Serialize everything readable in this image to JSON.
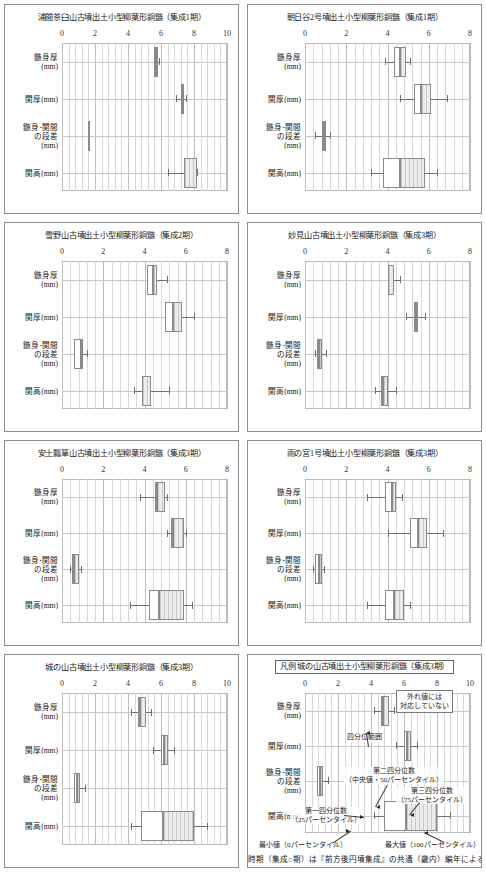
{
  "figure": {
    "axis_labels": [
      "鏃身厚\n(mm)",
      "関厚(mm)",
      "鏃身-関間\nの段差\n(mm)",
      "関高(mm)"
    ],
    "footer_note": "時期（集成○期）は『前方後円墳集成』の共通（畿内）編年による"
  },
  "legend_annotations": {
    "outlier": "外れ値には\n対応していない",
    "iqr_range": "四分位範囲",
    "median": "第二四分位数\n（中央値・50パーセンタイル）",
    "q3": "第三四分位数\n（75パーセンタイル）",
    "q1": "第一四分位数\n（25パーセンタイル）",
    "min": "最小値（0パーセンタイル）",
    "max": "最大値（100パーセンタイル）"
  },
  "chart_data": [
    {
      "type": "boxplot",
      "title": "浦間茶臼山古墳出土小型柳葉形銅鏃（集成1期）",
      "xlim": [
        0,
        10
      ],
      "xticks": [
        0,
        2,
        4,
        6,
        8,
        10
      ],
      "minor_per_major": 5,
      "grid": true,
      "xlabel": "",
      "ylabel": "",
      "categories": [
        "鏃身厚(mm)",
        "関厚(mm)",
        "鏃身-関間の段差(mm)",
        "関高(mm)"
      ],
      "boxes": [
        {
          "category": "鏃身厚(mm)",
          "min": 5.6,
          "q1": 5.6,
          "median": 5.7,
          "q3": 5.8,
          "max": 5.9
        },
        {
          "category": "関厚(mm)",
          "min": 6.9,
          "q1": 7.2,
          "median": 7.3,
          "q3": 7.4,
          "max": 7.5
        },
        {
          "category": "鏃身-関間の段差(mm)",
          "min": 1.6,
          "q1": 1.6,
          "median": 1.6,
          "q3": 1.6,
          "max": 1.6
        },
        {
          "category": "関高(mm)",
          "min": 6.4,
          "q1": 7.4,
          "median": 7.4,
          "q3": 8.2,
          "max": 8.2
        }
      ]
    },
    {
      "type": "boxplot",
      "title": "朝日谷2号墳出土小型柳葉形銅鏃（集成1期）",
      "xlim": [
        0,
        8
      ],
      "xticks": [
        0,
        2,
        4,
        6,
        8
      ],
      "minor_per_major": 5,
      "grid": true,
      "xlabel": "",
      "ylabel": "",
      "categories": [
        "鏃身厚(mm)",
        "関厚(mm)",
        "鏃身-関間の段差(mm)",
        "関高(mm)"
      ],
      "boxes": [
        {
          "category": "鏃身厚(mm)",
          "min": 3.9,
          "q1": 4.3,
          "median": 4.6,
          "q3": 4.9,
          "max": 5.1
        },
        {
          "category": "関厚(mm)",
          "min": 4.6,
          "q1": 5.3,
          "median": 5.6,
          "q3": 6.1,
          "max": 6.9
        },
        {
          "category": "鏃身-関間の段差(mm)",
          "min": 0.5,
          "q1": 0.8,
          "median": 0.9,
          "q3": 1.0,
          "max": 1.2
        },
        {
          "category": "関高(mm)",
          "min": 3.2,
          "q1": 3.8,
          "median": 4.6,
          "q3": 5.8,
          "max": 6.4
        }
      ]
    },
    {
      "type": "boxplot",
      "title": "雪野山古墳出土小型柳葉形銅鏃（集成2期）",
      "xlim": [
        0,
        8
      ],
      "xticks": [
        0,
        2,
        4,
        6,
        8
      ],
      "minor_per_major": 5,
      "grid": true,
      "xlabel": "",
      "ylabel": "",
      "categories": [
        "鏃身厚(mm)",
        "関厚(mm)",
        "鏃身-関間の段差(mm)",
        "関高(mm)"
      ],
      "boxes": [
        {
          "category": "鏃身厚(mm)",
          "min": 4.1,
          "q1": 4.1,
          "median": 4.4,
          "q3": 4.6,
          "max": 5.1
        },
        {
          "category": "関厚(mm)",
          "min": 5.0,
          "q1": 5.0,
          "median": 5.4,
          "q3": 5.8,
          "max": 6.4
        },
        {
          "category": "鏃身-関間の段差(mm)",
          "min": 0.6,
          "q1": 0.6,
          "median": 0.9,
          "q3": 1.0,
          "max": 1.2
        },
        {
          "category": "関高(mm)",
          "min": 3.5,
          "q1": 3.9,
          "median": 3.9,
          "q3": 4.3,
          "max": 5.2
        }
      ]
    },
    {
      "type": "boxplot",
      "title": "妙見山古墳出土小型柳葉形銅鏃（集成3期）",
      "xlim": [
        0,
        8
      ],
      "xticks": [
        0,
        2,
        4,
        6,
        8
      ],
      "minor_per_major": 5,
      "grid": true,
      "xlabel": "",
      "ylabel": "",
      "categories": [
        "鏃身厚(mm)",
        "関厚(mm)",
        "鏃身-関間の段差(mm)",
        "関高(mm)"
      ],
      "boxes": [
        {
          "category": "鏃身厚(mm)",
          "min": 4.0,
          "q1": 4.0,
          "median": 4.0,
          "q3": 4.3,
          "max": 4.6
        },
        {
          "category": "関厚(mm)",
          "min": 4.9,
          "q1": 5.3,
          "median": 5.4,
          "q3": 5.5,
          "max": 5.8
        },
        {
          "category": "鏃身-関間の段差(mm)",
          "min": 0.5,
          "q1": 0.6,
          "median": 0.7,
          "q3": 0.8,
          "max": 1.0
        },
        {
          "category": "関高(mm)",
          "min": 3.4,
          "q1": 3.7,
          "median": 3.8,
          "q3": 4.0,
          "max": 4.4
        }
      ]
    },
    {
      "type": "boxplot",
      "title": "安土瓢箪山古墳出土小型柳葉形銅鏃（集成3期）",
      "xlim": [
        0,
        8
      ],
      "xticks": [
        0,
        2,
        4,
        6,
        8
      ],
      "minor_per_major": 5,
      "grid": true,
      "xlabel": "",
      "ylabel": "",
      "categories": [
        "鏃身厚(mm)",
        "関厚(mm)",
        "鏃身-関間の段差(mm)",
        "関高(mm)"
      ],
      "boxes": [
        {
          "category": "鏃身厚(mm)",
          "min": 3.8,
          "q1": 4.5,
          "median": 4.6,
          "q3": 5.0,
          "max": 5.1
        },
        {
          "category": "関厚(mm)",
          "min": 5.1,
          "q1": 5.3,
          "median": 5.4,
          "q3": 5.9,
          "max": 6.0
        },
        {
          "category": "鏃身-関間の段差(mm)",
          "min": 0.4,
          "q1": 0.5,
          "median": 0.6,
          "q3": 0.8,
          "max": 0.9
        },
        {
          "category": "関高(mm)",
          "min": 3.3,
          "q1": 4.2,
          "median": 4.7,
          "q3": 5.9,
          "max": 6.3
        }
      ]
    },
    {
      "type": "boxplot",
      "title": "雨の宮1号墳出土小型柳葉形銅鏃（集成3期）",
      "xlim": [
        0,
        8
      ],
      "xticks": [
        0,
        2,
        4,
        6,
        8
      ],
      "minor_per_major": 5,
      "grid": true,
      "xlabel": "",
      "ylabel": "",
      "categories": [
        "鏃身厚(mm)",
        "関厚(mm)",
        "鏃身-関間の段差(mm)",
        "関高(mm)"
      ],
      "boxes": [
        {
          "category": "鏃身厚(mm)",
          "min": 3.0,
          "q1": 3.9,
          "median": 4.2,
          "q3": 4.4,
          "max": 4.7
        },
        {
          "category": "関厚(mm)",
          "min": 4.0,
          "q1": 5.1,
          "median": 5.5,
          "q3": 5.9,
          "max": 6.7
        },
        {
          "category": "鏃身-関間の段差(mm)",
          "min": 0.4,
          "q1": 0.5,
          "median": 0.7,
          "q3": 0.8,
          "max": 0.9
        },
        {
          "category": "関高(mm)",
          "min": 3.0,
          "q1": 3.9,
          "median": 4.3,
          "q3": 4.8,
          "max": 5.1
        }
      ]
    },
    {
      "type": "boxplot",
      "title": "城の山古墳出土小型柳葉形銅鏃（集成3期）",
      "xlim": [
        0,
        10
      ],
      "xticks": [
        0,
        2,
        4,
        6,
        8,
        10
      ],
      "minor_per_major": 5,
      "grid": true,
      "xlabel": "",
      "ylabel": "",
      "categories": [
        "鏃身厚(mm)",
        "関厚(mm)",
        "鏃身-関間の段差(mm)",
        "関高(mm)"
      ],
      "boxes": [
        {
          "category": "鏃身厚(mm)",
          "min": 4.2,
          "q1": 4.6,
          "median": 4.7,
          "q3": 5.1,
          "max": 5.4
        },
        {
          "category": "関厚(mm)",
          "min": 5.5,
          "q1": 6.0,
          "median": 6.2,
          "q3": 6.4,
          "max": 6.8
        },
        {
          "category": "鏃身-関間の段差(mm)",
          "min": 0.7,
          "q1": 0.7,
          "median": 0.9,
          "q3": 1.1,
          "max": 1.4
        },
        {
          "category": "関高(mm)",
          "min": 4.2,
          "q1": 4.8,
          "median": 6.1,
          "q3": 8.0,
          "max": 8.8
        }
      ]
    },
    {
      "type": "boxplot",
      "title": "凡例 城の山古墳出土小型柳葉形銅鏃（集成3期）",
      "is_legend": true,
      "xlim": [
        0,
        10
      ],
      "xticks": [
        0,
        2,
        4,
        6,
        8,
        10
      ],
      "minor_per_major": 5,
      "grid": true,
      "xlabel": "",
      "ylabel": "",
      "categories": [
        "鏃身厚(mm)",
        "関厚(mm)",
        "鏃身-関間の段差(mm)",
        "関高(mm)"
      ],
      "boxes": [
        {
          "category": "鏃身厚(mm)",
          "min": 4.2,
          "q1": 4.6,
          "median": 4.7,
          "q3": 5.1,
          "max": 5.4
        },
        {
          "category": "関厚(mm)",
          "min": 5.5,
          "q1": 6.0,
          "median": 6.2,
          "q3": 6.4,
          "max": 6.8
        },
        {
          "category": "鏃身-関間の段差(mm)",
          "min": 0.7,
          "q1": 0.7,
          "median": 0.9,
          "q3": 1.1,
          "max": 1.4
        },
        {
          "category": "関高(mm)",
          "min": 4.2,
          "q1": 4.8,
          "median": 6.1,
          "q3": 8.0,
          "max": 8.8
        }
      ]
    }
  ]
}
